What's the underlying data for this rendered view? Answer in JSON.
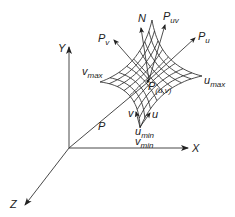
{
  "diagram": {
    "type": "parametric-surface-coordinate-diagram",
    "axes": {
      "x_label": "X",
      "y_label": "Y",
      "z_label": "Z"
    },
    "position_vector": {
      "label": "P"
    },
    "point": {
      "base": "P",
      "sub": "(u,v)"
    },
    "vectors": {
      "normal": {
        "label": "N"
      },
      "p_u": {
        "base": "P",
        "sub": "u"
      },
      "p_v": {
        "base": "P",
        "sub": "v"
      },
      "p_uv": {
        "base": "P",
        "sub": "uv"
      }
    },
    "param_directions": {
      "u": "u",
      "v": "v"
    },
    "bounds": {
      "u_max": {
        "base": "u",
        "sub": "max"
      },
      "v_max": {
        "base": "v",
        "sub": "max"
      },
      "u_min": {
        "base": "u",
        "sub": "min"
      },
      "v_min": {
        "base": "v",
        "sub": "min"
      }
    },
    "colors": {
      "line": "#222222",
      "background": "#ffffff"
    }
  }
}
